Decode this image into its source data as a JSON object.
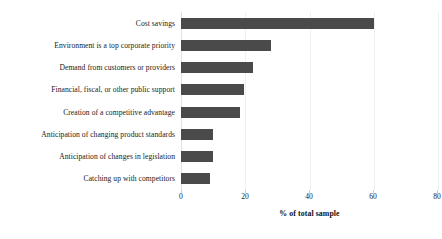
{
  "chart_data": {
    "type": "bar",
    "orientation": "horizontal",
    "title": "",
    "xlabel": "% of total sample",
    "ylabel": "",
    "xlim": [
      0,
      80
    ],
    "xticks": [
      0,
      20,
      40,
      60,
      80
    ],
    "grid": true,
    "legend": null,
    "bar_color": "#4a4a4a",
    "categories": [
      "Cost savings",
      "Environment is a top corporate priority",
      "Demand from customers or providers",
      "Financial, fiscal, or other public support",
      "Creation of a competitive advantage",
      "Anticipation of changing product standards",
      "Anticipation of changes in legislation",
      "Catching up with competitors"
    ],
    "values": [
      60,
      28,
      22.5,
      19.5,
      18.5,
      10,
      10,
      9
    ]
  },
  "axis": {
    "x_title": "% of total sample",
    "tick_labels": [
      "0",
      "20",
      "40",
      "60",
      "80"
    ]
  }
}
